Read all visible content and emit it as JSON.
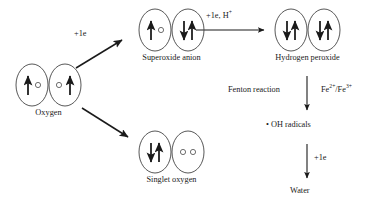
{
  "figure": {
    "background_color": "#ffffff",
    "ink_color": "#1a1a1a"
  },
  "species": {
    "oxygen": {
      "label": "Oxygen",
      "orbitals": [
        {
          "electrons": [
            "up",
            "empty"
          ]
        },
        {
          "electrons": [
            "empty",
            "up"
          ]
        }
      ]
    },
    "superoxide": {
      "label": "Superoxide anion",
      "orbitals": [
        {
          "electrons": [
            "up",
            "empty"
          ]
        },
        {
          "electrons": [
            "down",
            "up"
          ]
        }
      ]
    },
    "peroxide": {
      "label": "Hydrogen peroxide",
      "orbitals": [
        {
          "electrons": [
            "down",
            "up"
          ]
        },
        {
          "electrons": [
            "down",
            "up"
          ]
        }
      ]
    },
    "singlet": {
      "label": "Singlet oxygen",
      "orbitals": [
        {
          "electrons": [
            "down",
            "up"
          ]
        },
        {
          "electrons": [
            "empty",
            "empty"
          ]
        }
      ]
    }
  },
  "nodes": {
    "oh_radicals": "• OH radicals",
    "water": "Water"
  },
  "reactions": {
    "oxygen_to_superoxide": "+1e",
    "superoxide_to_peroxide": "+1e, H",
    "superoxide_to_peroxide_sup": "+",
    "oxygen_to_singlet": "",
    "fenton_name": "Fenton reaction",
    "fenton_catalyst_a": "Fe",
    "fenton_catalyst_a_sup": "2+",
    "fenton_catalyst_sep": "/Fe",
    "fenton_catalyst_b_sup": "3+",
    "radicals_to_water": "+1e"
  }
}
